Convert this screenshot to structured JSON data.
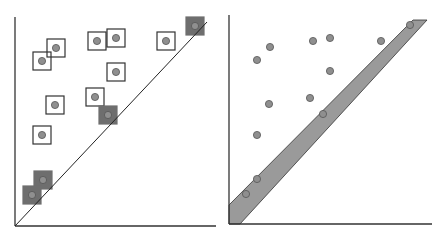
{
  "colors": {
    "axis": "#333333",
    "point_fill": "#8f8f8f",
    "point_stroke": "#555555",
    "box_stroke": "#333333",
    "box_dark_fill": "#6e6e6e",
    "band_fill": "#9a9a9a",
    "band_stroke": "#333333"
  },
  "left_panel": {
    "name": "box-cover-diagram",
    "axis": {
      "origin": [
        15,
        226
      ],
      "y_top": 17,
      "x_right": 216
    },
    "diagonal": {
      "from": [
        15,
        226
      ],
      "to": [
        207,
        22
      ]
    },
    "box_size": 18,
    "points": [
      {
        "x": 42,
        "y": 61,
        "dark": false
      },
      {
        "x": 56,
        "y": 48,
        "dark": false
      },
      {
        "x": 97,
        "y": 41,
        "dark": false
      },
      {
        "x": 116,
        "y": 38,
        "dark": false
      },
      {
        "x": 166,
        "y": 41,
        "dark": false
      },
      {
        "x": 195,
        "y": 26,
        "dark": true
      },
      {
        "x": 116,
        "y": 72,
        "dark": false
      },
      {
        "x": 55,
        "y": 105,
        "dark": false
      },
      {
        "x": 95,
        "y": 97,
        "dark": false
      },
      {
        "x": 108,
        "y": 115,
        "dark": true
      },
      {
        "x": 42,
        "y": 135,
        "dark": false
      },
      {
        "x": 43,
        "y": 180,
        "dark": true
      },
      {
        "x": 32,
        "y": 195,
        "dark": true
      }
    ]
  },
  "right_panel": {
    "name": "band-diagram",
    "axis": {
      "origin": [
        229,
        224
      ],
      "y_top": 15,
      "x_right": 432
    },
    "band": [
      [
        229,
        224
      ],
      [
        229,
        205
      ],
      [
        413,
        20
      ],
      [
        427,
        20
      ],
      [
        240,
        224
      ]
    ],
    "points": [
      {
        "x": 257,
        "y": 60
      },
      {
        "x": 270,
        "y": 47
      },
      {
        "x": 313,
        "y": 41
      },
      {
        "x": 330,
        "y": 38
      },
      {
        "x": 381,
        "y": 41
      },
      {
        "x": 410,
        "y": 25
      },
      {
        "x": 330,
        "y": 71
      },
      {
        "x": 269,
        "y": 104
      },
      {
        "x": 310,
        "y": 98
      },
      {
        "x": 323,
        "y": 114
      },
      {
        "x": 257,
        "y": 135
      },
      {
        "x": 257,
        "y": 179
      },
      {
        "x": 246,
        "y": 194
      }
    ]
  }
}
